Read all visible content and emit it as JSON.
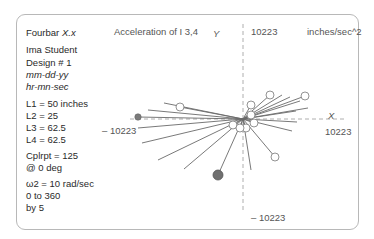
{
  "panel": {
    "app_title": "Fourbar",
    "app_version": "X.x",
    "author": "Ima Student",
    "design": "Design # 1",
    "date": "mm-dd-yy",
    "time": "hr-mn-sec",
    "links": [
      "L1 =  50 inches",
      "L2 =  25",
      "L3 =  62.5",
      "L4 =  62.5"
    ],
    "coupler": "Cplrpt = 125",
    "coupler_angle": "@  0  deg",
    "omega": "ω2 =  10 rad/sec",
    "range": "0 to 360",
    "step": "by 5"
  },
  "chart_data": {
    "type": "scatter",
    "title": "Acceleration of  I  3,4",
    "units": "inches/sec^2",
    "xlabel": "X",
    "ylabel": "Y",
    "xlim": [
      -10223,
      10223
    ],
    "ylim": [
      -10223,
      10223
    ],
    "tick_labels": {
      "x_max": "10223",
      "x_min": "– 10223",
      "y_max": "10223",
      "y_min": "– 10223"
    },
    "series": [
      {
        "name": "acceleration-vectors",
        "points": [
          {
            "x": 3067,
            "y": 2726,
            "marker": "open"
          },
          {
            "x": 4430,
            "y": 2726,
            "marker": "none"
          },
          {
            "x": 5339,
            "y": 2499,
            "marker": "none"
          },
          {
            "x": 6475,
            "y": 2045,
            "marker": "none"
          },
          {
            "x": 7043,
            "y": 2613,
            "marker": "open"
          },
          {
            "x": 7384,
            "y": 1250,
            "marker": "none"
          },
          {
            "x": 6020,
            "y": 909,
            "marker": "none"
          },
          {
            "x": 6134,
            "y": -341,
            "marker": "none"
          },
          {
            "x": 5566,
            "y": -1363,
            "marker": "none"
          },
          {
            "x": 3635,
            "y": -4317,
            "marker": "open"
          },
          {
            "x": 909,
            "y": -5794,
            "marker": "none"
          },
          {
            "x": -2840,
            "y": -6362,
            "marker": "filled-large"
          },
          {
            "x": -6702,
            "y": -5680,
            "marker": "none"
          },
          {
            "x": -9656,
            "y": -4658,
            "marker": "none"
          },
          {
            "x": -11474,
            "y": -2726,
            "marker": "none"
          },
          {
            "x": -11928,
            "y": -1022,
            "marker": "none"
          },
          {
            "x": -11928,
            "y": 227,
            "marker": "filled"
          },
          {
            "x": -10792,
            "y": 1022,
            "marker": "none"
          },
          {
            "x": -7157,
            "y": 1363,
            "marker": "open"
          },
          {
            "x": -8974,
            "y": 1818,
            "marker": "none"
          },
          {
            "x": 909,
            "y": 1590,
            "marker": "open"
          },
          {
            "x": 909,
            "y": 454,
            "marker": "open"
          },
          {
            "x": 1250,
            "y": -454,
            "marker": "open"
          },
          {
            "x": -1136,
            "y": -681,
            "marker": "open"
          },
          {
            "x": 341,
            "y": -1022,
            "marker": "open"
          },
          {
            "x": -341,
            "y": -1022,
            "marker": "open"
          }
        ]
      }
    ]
  }
}
